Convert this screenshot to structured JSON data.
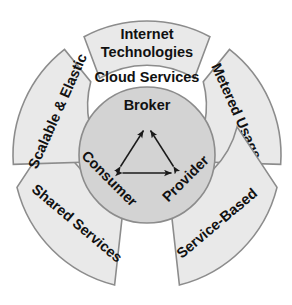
{
  "diagram": {
    "title": "Cloud Services",
    "center_label": "Cloud Services",
    "colors": {
      "ring_fill": "#e9e9e9",
      "core_fill": "#d3d3d3",
      "outline": "#8c8c8c",
      "text": "#111111",
      "arrow": "#1a1a1a",
      "background": "#ffffff"
    },
    "ring_segments": [
      {
        "id": "internet-technologies",
        "label": "Internet Technologies",
        "line1": "Internet",
        "line2": "Technologies",
        "position": "top",
        "text_orientation": "horizontal"
      },
      {
        "id": "metered-usage",
        "label": "Metered Usage",
        "position": "upper-right",
        "text_orientation": "clockwise-down"
      },
      {
        "id": "service-based",
        "label": "Service-Based",
        "position": "lower-right",
        "text_orientation": "ascending"
      },
      {
        "id": "shared-services",
        "label": "Shared Services",
        "position": "lower-left",
        "text_orientation": "descending"
      },
      {
        "id": "scalable-elastic",
        "label": "Scalable & Elastic",
        "position": "upper-left",
        "text_orientation": "counterclockwise-up"
      }
    ],
    "core": {
      "nodes": [
        {
          "id": "broker",
          "label": "Broker",
          "position": "top",
          "text_orientation": "horizontal"
        },
        {
          "id": "consumer",
          "label": "Consumer",
          "position": "bottom-left",
          "text_orientation": "rotated-45"
        },
        {
          "id": "provider",
          "label": "Provider",
          "position": "bottom-right",
          "text_orientation": "rotated-315"
        }
      ],
      "connections": [
        {
          "from": "broker",
          "to": "consumer",
          "style": "double-headed-arrow"
        },
        {
          "from": "broker",
          "to": "provider",
          "style": "double-headed-arrow"
        },
        {
          "from": "consumer",
          "to": "provider",
          "style": "double-headed-arrow"
        }
      ]
    }
  }
}
